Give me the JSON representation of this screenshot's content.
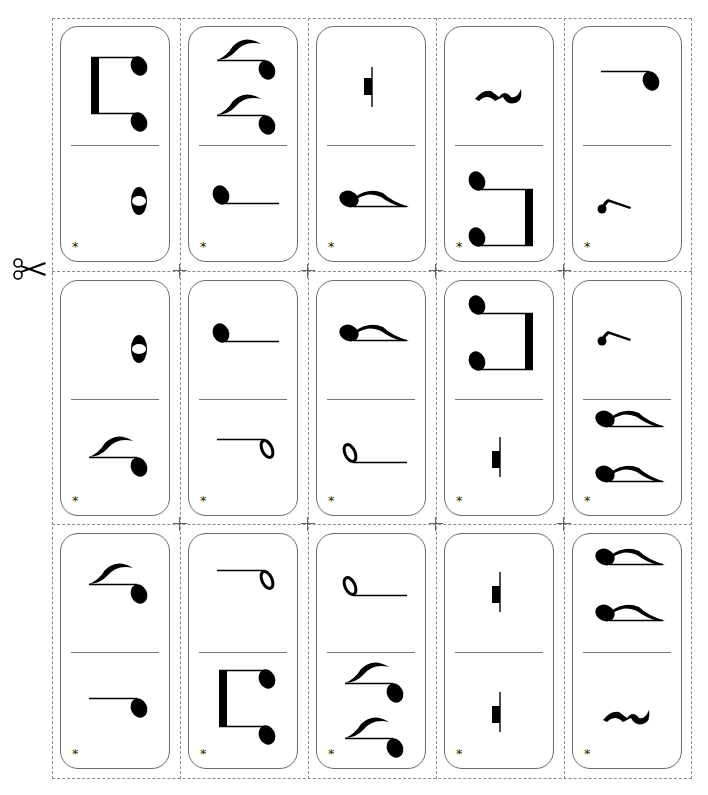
{
  "sheet": {
    "title": "Rhythm Domino Cards",
    "cut_marker": "scissors-icon",
    "card_mark": "*",
    "colors": {
      "ink": "#000000",
      "border": "#6a6a6a",
      "cut_line": "#8a8a8a"
    }
  },
  "cards": [
    {
      "row": 1,
      "col": 1,
      "top": "two-sixteenths-beamed",
      "bottom": "whole-note",
      "mark": "*"
    },
    {
      "row": 1,
      "col": 2,
      "top": "two-eighth-notes-flagged",
      "bottom": "quarter-note",
      "mark": "*"
    },
    {
      "row": 1,
      "col": 3,
      "top": "half-rest",
      "bottom": "eighth-note",
      "mark": "*"
    },
    {
      "row": 1,
      "col": 4,
      "top": "quarter-rest",
      "bottom": "two-eighths-beamed",
      "mark": "*"
    },
    {
      "row": 1,
      "col": 5,
      "top": "quarter-note",
      "bottom": "eighth-rest",
      "mark": "*"
    },
    {
      "row": 2,
      "col": 1,
      "top": "whole-note",
      "bottom": "eighth-note",
      "mark": "*"
    },
    {
      "row": 2,
      "col": 2,
      "top": "quarter-note",
      "bottom": "half-note",
      "mark": "*"
    },
    {
      "row": 2,
      "col": 3,
      "top": "eighth-note",
      "bottom": "half-note",
      "mark": "*"
    },
    {
      "row": 2,
      "col": 4,
      "top": "two-eighths-beamed",
      "bottom": "half-rest",
      "mark": "*"
    },
    {
      "row": 2,
      "col": 5,
      "top": "eighth-rest",
      "bottom": "two-eighth-notes-flagged",
      "mark": "*"
    },
    {
      "row": 3,
      "col": 1,
      "top": "eighth-note",
      "bottom": "quarter-note",
      "mark": "*"
    },
    {
      "row": 3,
      "col": 2,
      "top": "half-note",
      "bottom": "two-sixteenths-beamed",
      "mark": "*"
    },
    {
      "row": 3,
      "col": 3,
      "top": "half-note",
      "bottom": "two-eighth-notes-flagged",
      "mark": "*"
    },
    {
      "row": 3,
      "col": 4,
      "top": "half-rest",
      "bottom": "whole-rest",
      "mark": "*"
    },
    {
      "row": 3,
      "col": 5,
      "top": "two-eighth-notes-flagged",
      "bottom": "quarter-rest",
      "mark": "*"
    }
  ]
}
